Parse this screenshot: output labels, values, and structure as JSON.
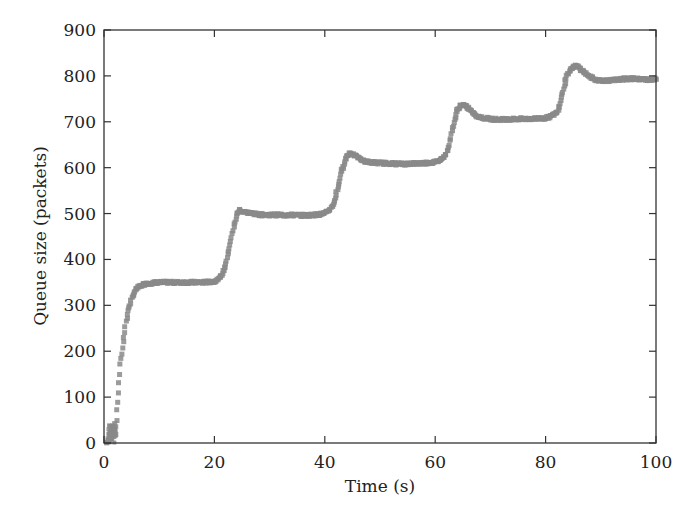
{
  "chart_data": {
    "type": "scatter",
    "title": "",
    "xlabel": "Time (s)",
    "ylabel": "Queue size (packets)",
    "xlim": [
      0,
      100
    ],
    "ylim": [
      0,
      900
    ],
    "xticks": [
      0,
      20,
      40,
      60,
      80,
      100
    ],
    "yticks": [
      0,
      100,
      200,
      300,
      400,
      500,
      600,
      700,
      800,
      900
    ],
    "grid": false,
    "legend": null,
    "marker_color": "#8a8a8a",
    "series": [
      {
        "name": "Queue size",
        "x": [
          0.5,
          1.0,
          1.5,
          1.8,
          2.0,
          2.3,
          2.6,
          3.0,
          3.5,
          4.0,
          4.5,
          5.0,
          5.5,
          6.0,
          7.0,
          8.0,
          9.0,
          10.0,
          12.0,
          14.0,
          16.0,
          18.0,
          20.0,
          21.0,
          21.5,
          22.0,
          22.5,
          23.0,
          23.5,
          24.0,
          24.5,
          25.0,
          26.0,
          27.0,
          28.0,
          30.0,
          32.0,
          34.0,
          36.0,
          38.0,
          40.0,
          41.0,
          41.5,
          42.0,
          42.5,
          43.0,
          43.5,
          44.0,
          44.5,
          45.0,
          46.0,
          47.0,
          48.0,
          50.0,
          52.0,
          54.0,
          56.0,
          58.0,
          60.0,
          61.0,
          62.0,
          62.5,
          63.0,
          63.5,
          64.0,
          64.5,
          65.0,
          66.0,
          67.0,
          68.0,
          70.0,
          72.0,
          74.0,
          76.0,
          78.0,
          80.0,
          81.0,
          82.0,
          82.5,
          83.0,
          83.5,
          84.0,
          84.5,
          85.0,
          85.5,
          86.0,
          87.0,
          88.0,
          89.0,
          90.0,
          92.0,
          94.0,
          96.0,
          98.0,
          100.0
        ],
        "y": [
          0,
          10,
          35,
          40,
          20,
          50,
          110,
          170,
          220,
          265,
          295,
          315,
          328,
          337,
          345,
          348,
          349,
          350,
          350,
          350,
          350,
          350,
          352,
          360,
          370,
          385,
          410,
          440,
          470,
          495,
          508,
          505,
          502,
          500,
          498,
          497,
          497,
          497,
          496,
          497,
          500,
          510,
          520,
          540,
          565,
          590,
          610,
          625,
          632,
          630,
          622,
          615,
          612,
          610,
          609,
          608,
          609,
          610,
          612,
          618,
          630,
          650,
          680,
          705,
          725,
          735,
          737,
          730,
          718,
          710,
          706,
          705,
          706,
          706,
          707,
          708,
          712,
          720,
          735,
          760,
          785,
          805,
          815,
          820,
          822,
          818,
          808,
          798,
          792,
          790,
          790,
          793,
          794,
          792,
          793
        ]
      }
    ]
  }
}
